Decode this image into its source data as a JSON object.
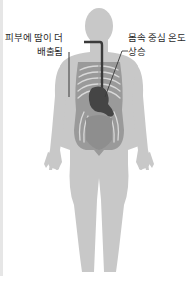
{
  "diagram": {
    "title": "",
    "labels": {
      "sweat": {
        "line1": "피부에 땀이 더",
        "line2": "배출됨"
      },
      "core_temp": {
        "line1": "몸속 중심 온도",
        "line2": "상승"
      }
    },
    "colors": {
      "body": "#c8c8c8",
      "torso_inner": "#9a9a9a",
      "ribs": "#d9d9d9",
      "stomach": "#454545",
      "esophagus": "#3a3a3a",
      "leader_line": "#3a3a3a",
      "left_strip": "#e6e6e6",
      "text": "#2b2b2b"
    },
    "elements": [
      "body-silhouette",
      "rib-cage",
      "esophagus",
      "stomach",
      "abdomen"
    ]
  }
}
